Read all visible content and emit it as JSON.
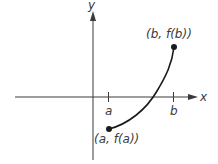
{
  "diagram": {
    "title": "",
    "axes": {
      "x_label": "x",
      "y_label": "y"
    },
    "ticks": [
      {
        "label": "a",
        "x": 108
      },
      {
        "label": "b",
        "x": 173
      }
    ],
    "points": [
      {
        "label": "(a, f(a))",
        "x": 109,
        "y": 129
      },
      {
        "label": "(b, f(b))",
        "x": 174,
        "y": 47
      }
    ],
    "curve": {
      "description": "increasing concave-down curve from (a, f(a)) below the x-axis to (b, f(b)) above it"
    },
    "colors": {
      "ink": "#1a1a1a",
      "label": "#3a3a3a",
      "background": "#ffffff"
    }
  }
}
